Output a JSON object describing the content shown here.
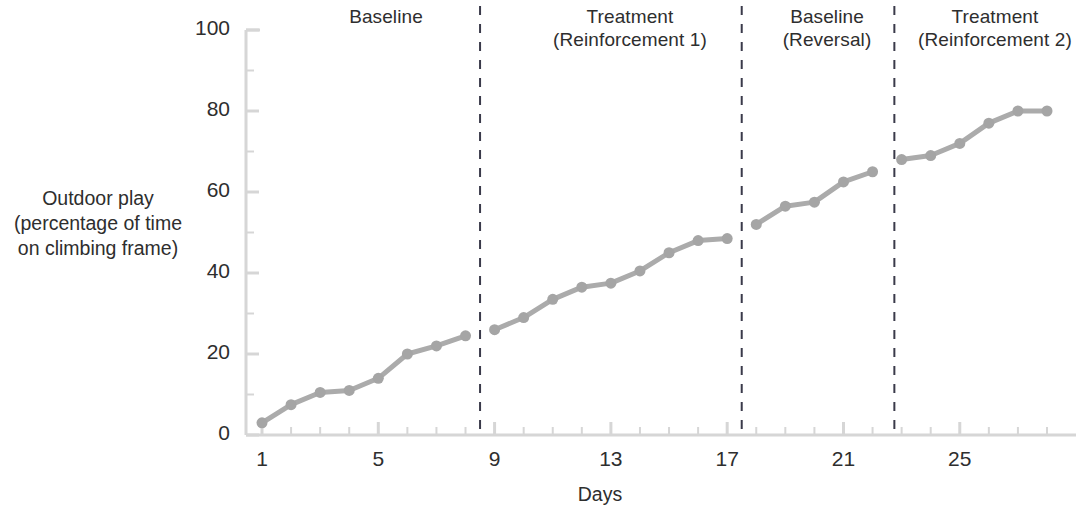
{
  "chart_data": {
    "type": "line",
    "title": "",
    "xlabel": "Days",
    "ylabel": "Outdoor play\n(percentage of time\non climbing frame)",
    "xlim": [
      0.4,
      28.6
    ],
    "ylim": [
      0,
      100
    ],
    "grid": false,
    "legend": "none",
    "x_ticks_labeled": [
      1,
      5,
      9,
      13,
      17,
      21,
      25
    ],
    "x_minor_tick_interval": 1,
    "y_ticks_labeled": [
      0,
      20,
      40,
      60,
      80,
      100
    ],
    "y_minor_tick_interval": 10,
    "series": [
      {
        "name": "Outdoor play",
        "x": [
          1,
          2,
          3,
          4,
          5,
          6,
          7,
          8,
          9,
          10,
          11,
          12,
          13,
          14,
          15,
          16,
          17,
          18,
          19,
          20,
          21,
          22,
          23,
          24,
          25,
          26,
          27,
          28
        ],
        "values": [
          3,
          7.5,
          10.5,
          11,
          14,
          20,
          22,
          24.5,
          26,
          29,
          33.5,
          36.5,
          37.5,
          40.5,
          45,
          48,
          48.5,
          52,
          56.5,
          57.5,
          62.5,
          65,
          68,
          69,
          72,
          77,
          80,
          80
        ]
      }
    ],
    "phases": [
      {
        "label": "Baseline",
        "x_start": 0.4,
        "x_end": 8.5,
        "center_x": 4.5
      },
      {
        "label": "Treatment\n(Reinforcement 1)",
        "x_start": 8.5,
        "x_end": 17.5,
        "center_x": 13.0
      },
      {
        "label": "Baseline\n(Reversal)",
        "x_start": 17.5,
        "x_end": 22.75,
        "center_x": 20.1
      },
      {
        "label": "Treatment\n(Reinforcement 2)",
        "x_start": 22.75,
        "x_end": 28.6,
        "center_x": 25.8
      }
    ],
    "phase_dividers_x": [
      8.5,
      17.5,
      22.75
    ],
    "colors": {
      "line": "#ababab",
      "marker": "#a5a5a5",
      "axis": "#d6d6d6",
      "divider": "#3a3a4a",
      "text": "#2e2e2e"
    }
  }
}
